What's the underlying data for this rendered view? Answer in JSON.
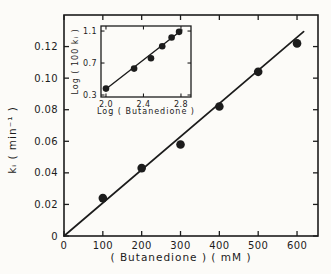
{
  "colors": {
    "ink": "#1c1c1c",
    "paper": "#fcfbf8"
  },
  "chart_data": [
    {
      "id": "main",
      "type": "scatter",
      "title": "",
      "xlabel": "( Butanedione ) ( mM )",
      "ylabel": "kᵢ ( min⁻¹ )",
      "xlim": [
        0,
        654
      ],
      "ylim": [
        0,
        0.14
      ],
      "xticks": [
        0,
        100,
        200,
        300,
        400,
        500,
        600
      ],
      "xtick_labels": [
        "0",
        "100",
        "200",
        "300",
        "400",
        "500",
        "600"
      ],
      "yticks": [
        0,
        0.02,
        0.04,
        0.06,
        0.08,
        0.1,
        0.12
      ],
      "ytick_labels": [
        "0",
        "0.02",
        "0.04",
        "0.06",
        "0.08",
        "0.10",
        "0.12"
      ],
      "points": [
        [
          100,
          0.024
        ],
        [
          200,
          0.043
        ],
        [
          300,
          0.058
        ],
        [
          400,
          0.082
        ],
        [
          500,
          0.104
        ],
        [
          600,
          0.122
        ]
      ],
      "fit_line": [
        [
          0,
          0
        ],
        [
          617,
          0.1295
        ]
      ],
      "grid": false,
      "legend": null
    },
    {
      "id": "inset",
      "type": "scatter",
      "title": "",
      "xlabel": "Log ( Butanedione )",
      "ylabel": "Log ( 100 kᵢ )",
      "xlim": [
        1.947,
        2.907
      ],
      "ylim": [
        0.275,
        1.163
      ],
      "xticks": [
        2.0,
        2.4,
        2.8
      ],
      "xtick_labels": [
        "2.0",
        "2.4",
        "2.8"
      ],
      "yticks": [
        0.3,
        0.7,
        1.1
      ],
      "ytick_labels": [
        "0.3",
        "0.7",
        "1.1"
      ],
      "points": [
        [
          2.0,
          0.38
        ],
        [
          2.3,
          0.63
        ],
        [
          2.48,
          0.76
        ],
        [
          2.6,
          0.91
        ],
        [
          2.7,
          1.02
        ],
        [
          2.78,
          1.09
        ]
      ],
      "fit_line": [
        [
          1.99,
          0.365
        ],
        [
          2.81,
          1.113
        ]
      ],
      "grid": false,
      "legend": null
    }
  ]
}
